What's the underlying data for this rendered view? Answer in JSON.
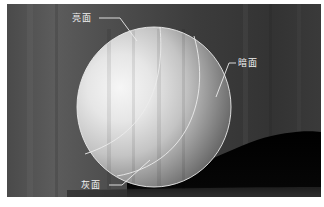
{
  "figure": {
    "labels": {
      "bright": "亮面",
      "dark": "暗面",
      "gray": "灰面"
    },
    "colors": {
      "border": "#ffffff",
      "background": "#4c4c4c",
      "shadow": "#050505",
      "sphere_highlight": "#f4f4f4",
      "sphere_shade": "#5e5e5e",
      "guide_lines": "#e8e8e8"
    }
  }
}
